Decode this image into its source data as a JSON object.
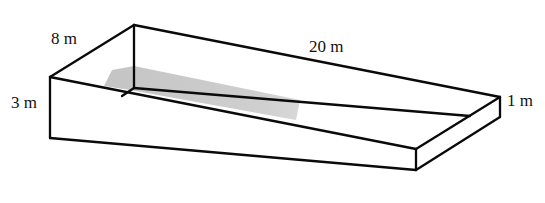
{
  "diagram": {
    "type": "3d-trough-sloped-floor",
    "labels": {
      "width": "8 m",
      "length": "20 m",
      "deep_end": "3 m",
      "shallow_end": "1 m"
    },
    "colors": {
      "edge": "#0a0a0a",
      "shaded_floor": "#c8c8c8",
      "background": "#ffffff"
    }
  }
}
